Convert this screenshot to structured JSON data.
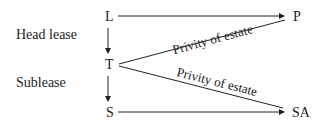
{
  "labels": {
    "head_lease": "Head lease",
    "sublease": "Sublease"
  },
  "nodes": {
    "L": "L",
    "T": "T",
    "S": "S",
    "P": "P",
    "SA": "SA"
  },
  "edges": {
    "upper_privity": "Privity of estate",
    "lower_privity": "Privity of estate"
  }
}
